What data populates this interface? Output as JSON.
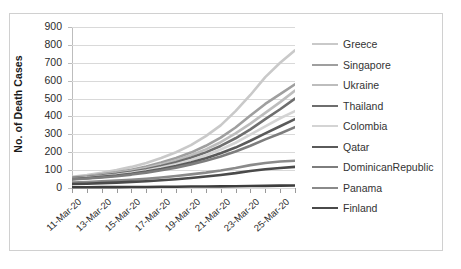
{
  "chart_data": {
    "type": "line",
    "title": "",
    "xlabel": "",
    "ylabel": "No. of Death Cases",
    "ylim": [
      0,
      900
    ],
    "ytick_step": 100,
    "yticks": [
      "0",
      "100",
      "200",
      "300",
      "400",
      "500",
      "600",
      "700",
      "800",
      "900"
    ],
    "grid": true,
    "legend_position": "right",
    "x": [
      "11-Mar-20",
      "12-Mar-20",
      "13-Mar-20",
      "14-Mar-20",
      "15-Mar-20",
      "16-Mar-20",
      "17-Mar-20",
      "18-Mar-20",
      "19-Mar-20",
      "20-Mar-20",
      "21-Mar-20",
      "22-Mar-20",
      "23-Mar-20",
      "24-Mar-20",
      "25-Mar-20",
      "26-Mar-20"
    ],
    "xtick_labels": [
      "11-Mar-20",
      "13-Mar-20",
      "15-Mar-20",
      "17-Mar-20",
      "19-Mar-20",
      "21-Mar-20",
      "23-Mar-20",
      "25-Mar-20"
    ],
    "series": [
      {
        "name": "Greece",
        "color": "#c9c9c9",
        "values": [
          62,
          72,
          85,
          100,
          118,
          140,
          168,
          200,
          240,
          290,
          350,
          430,
          520,
          620,
          700,
          770
        ]
      },
      {
        "name": "Singapore",
        "color": "#9f9f9f",
        "values": [
          58,
          66,
          76,
          88,
          102,
          120,
          142,
          168,
          198,
          236,
          282,
          338,
          405,
          470,
          525,
          580
        ]
      },
      {
        "name": "Ukraine",
        "color": "#bdbdbd",
        "values": [
          56,
          63,
          72,
          83,
          96,
          112,
          132,
          155,
          183,
          216,
          256,
          305,
          360,
          420,
          480,
          545
        ]
      },
      {
        "name": "Thailand",
        "color": "#6e6e6e",
        "values": [
          55,
          61,
          69,
          79,
          91,
          105,
          123,
          144,
          169,
          199,
          235,
          278,
          328,
          385,
          440,
          500
        ]
      },
      {
        "name": "Colombia",
        "color": "#d4d4d4",
        "values": [
          52,
          58,
          65,
          74,
          85,
          98,
          114,
          133,
          156,
          183,
          215,
          253,
          298,
          345,
          390,
          430
        ]
      },
      {
        "name": "Qatar",
        "color": "#5a5a5a",
        "values": [
          50,
          55,
          62,
          70,
          80,
          92,
          106,
          123,
          143,
          166,
          194,
          226,
          264,
          305,
          345,
          385
        ]
      },
      {
        "name": "DominicanRepublic",
        "color": "#7d7d7d",
        "values": [
          48,
          53,
          59,
          66,
          75,
          86,
          99,
          114,
          132,
          152,
          176,
          204,
          236,
          272,
          305,
          340
        ]
      },
      {
        "name": "Panama",
        "color": "#8a8a8a",
        "values": [
          30,
          33,
          37,
          41,
          46,
          52,
          59,
          67,
          76,
          86,
          98,
          112,
          128,
          140,
          148,
          152
        ]
      },
      {
        "name": "Finland",
        "color": "#4a4a4a",
        "values": [
          22,
          24,
          27,
          30,
          34,
          38,
          43,
          49,
          56,
          64,
          73,
          83,
          95,
          105,
          112,
          118
        ]
      }
    ],
    "baseline_series": {
      "name": "baseline",
      "color": "#3d3d3d",
      "values": [
        4,
        4,
        5,
        5,
        6,
        6,
        7,
        7,
        8,
        8,
        9,
        10,
        11,
        12,
        13,
        14
      ]
    }
  }
}
